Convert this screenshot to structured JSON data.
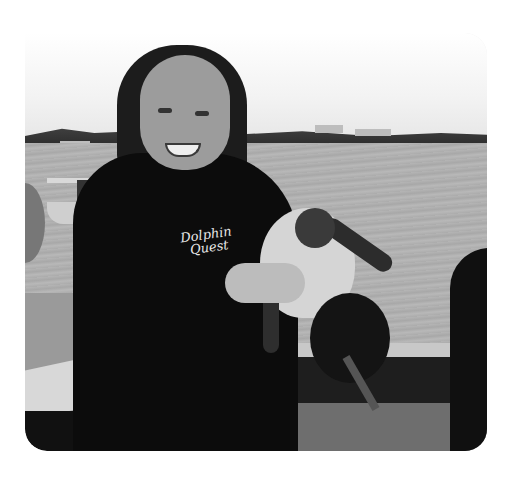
{
  "image": {
    "description": "Grayscale photo of a smiling woman in a black wetsuit holding a small sea turtle on a boat deck, water and shoreline in the background",
    "style": "grayscale",
    "corner_style": "rounded (top-left square)"
  },
  "wetsuit_logo": {
    "line1": "Dolphin",
    "line2": "Quest"
  },
  "scene": {
    "subject": "woman holding sea turtle",
    "background": [
      "sky",
      "shoreline with houses and trees",
      "water",
      "small boat"
    ],
    "foreground": [
      "boat deck",
      "railing",
      "snorkel gear"
    ]
  }
}
